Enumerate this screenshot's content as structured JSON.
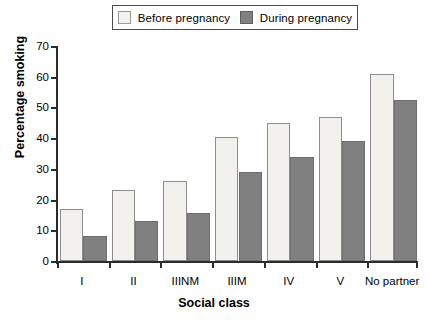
{
  "chart_data": {
    "type": "bar",
    "title": "",
    "xlabel": "Social class",
    "ylabel": "Percentage smoking",
    "categories": [
      "I",
      "II",
      "IIINM",
      "IIIM",
      "IV",
      "V",
      "No partner"
    ],
    "series": [
      {
        "name": "Before pregnancy",
        "color": "#f2f1ee",
        "values": [
          17,
          23,
          26,
          40.5,
          45,
          47,
          61
        ]
      },
      {
        "name": "During pregnancy",
        "color": "#808080",
        "values": [
          8,
          13,
          15.5,
          29,
          34,
          39,
          52.5
        ]
      }
    ],
    "ylim": [
      0,
      70
    ],
    "ytick_labels": [
      "0",
      "10",
      "20",
      "30",
      "40",
      "50",
      "60",
      "70"
    ],
    "ytick_values": [
      0,
      10,
      20,
      30,
      40,
      50,
      60,
      70
    ],
    "grid": false,
    "legend_position": "top-center"
  },
  "legend": {
    "entries": [
      {
        "label": "Before pregnancy",
        "swatch": "light"
      },
      {
        "label": "During pregnancy",
        "swatch": "dark"
      }
    ]
  }
}
